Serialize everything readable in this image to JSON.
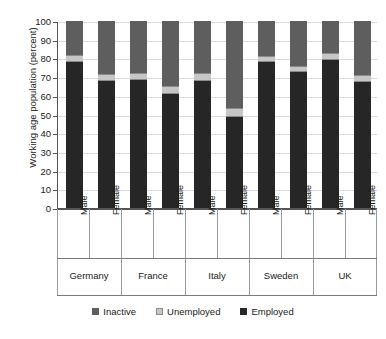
{
  "chart_data": {
    "type": "bar",
    "subtype": "stacked-100-percent",
    "title": "",
    "xlabel": "",
    "ylabel": "Working age population (percent)",
    "ylim": [
      0,
      100
    ],
    "ytick_step": 10,
    "yticks": [
      0,
      10,
      20,
      30,
      40,
      50,
      60,
      70,
      80,
      90,
      100
    ],
    "grid": true,
    "legend_position": "bottom",
    "groups": [
      "Germany",
      "France",
      "Italy",
      "Sweden",
      "UK"
    ],
    "subcategories": [
      "Male",
      "Female"
    ],
    "categories": [
      "Germany Male",
      "Germany Female",
      "France Male",
      "France Female",
      "Italy Male",
      "Italy Female",
      "Sweden Male",
      "Sweden Female",
      "UK Male",
      "UK Female"
    ],
    "series": [
      {
        "name": "Employed",
        "color": "#262626",
        "values": [
          78,
          68,
          68.5,
          61,
          68,
          48.5,
          78,
          73,
          79,
          67.5
        ]
      },
      {
        "name": "Unemployed",
        "color": "#c6c6c6",
        "values": [
          4,
          3.5,
          3.5,
          4.5,
          4,
          5,
          3.5,
          3,
          4,
          3.5
        ]
      },
      {
        "name": "Inactive",
        "color": "#5e5e5e",
        "values": [
          18,
          28.5,
          28,
          34.5,
          28,
          46.5,
          18.5,
          24,
          17,
          29
        ]
      }
    ]
  },
  "axis": {
    "y_title": "Working age population (percent)",
    "y_labels": [
      "100",
      "90",
      "80",
      "70",
      "60",
      "50",
      "40",
      "30",
      "20",
      "10",
      "0"
    ]
  },
  "gender_labels": [
    "Male",
    "Female",
    "Male",
    "Female",
    "Male",
    "Female",
    "Male",
    "Female",
    "Male",
    "Female"
  ],
  "country_labels": [
    "Germany",
    "France",
    "Italy",
    "Sweden",
    "UK"
  ],
  "legend": {
    "items": [
      {
        "label": "Inactive",
        "color": "#5e5e5e"
      },
      {
        "label": "Unemployed",
        "color": "#c6c6c6"
      },
      {
        "label": "Employed",
        "color": "#262626"
      }
    ]
  }
}
